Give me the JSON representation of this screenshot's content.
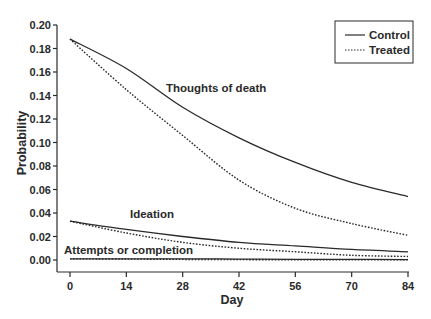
{
  "chart_data": {
    "type": "line",
    "title": "",
    "xlabel": "Day",
    "ylabel": "Probability",
    "xlim": [
      0,
      84
    ],
    "ylim": [
      0,
      0.2
    ],
    "x_ticks": [
      0,
      14,
      28,
      42,
      56,
      70,
      84
    ],
    "x_tick_labels": [
      "0",
      "14",
      "28",
      "42",
      "56",
      "70",
      "84"
    ],
    "y_ticks": [
      0.0,
      0.02,
      0.04,
      0.06,
      0.08,
      0.1,
      0.12,
      0.14,
      0.16,
      0.18,
      0.2
    ],
    "y_tick_labels": [
      "0.00",
      "0.02",
      "0.04",
      "0.06",
      "0.08",
      "0.10",
      "0.12",
      "0.14",
      "0.16",
      "0.18",
      "0.20"
    ],
    "grid": false,
    "legend_position": "top-right",
    "legend": [
      {
        "label": "Control",
        "style": "solid"
      },
      {
        "label": "Treated",
        "style": "dotted"
      }
    ],
    "x": [
      0,
      14,
      28,
      42,
      56,
      70,
      84
    ],
    "series": [
      {
        "name": "Thoughts of death - Control",
        "group": "Thoughts of death",
        "arm": "Control",
        "style": "solid",
        "values": [
          0.188,
          0.163,
          0.13,
          0.104,
          0.083,
          0.066,
          0.054
        ]
      },
      {
        "name": "Thoughts of death - Treated",
        "group": "Thoughts of death",
        "arm": "Treated",
        "style": "dotted",
        "values": [
          0.188,
          0.145,
          0.106,
          0.068,
          0.044,
          0.031,
          0.021
        ]
      },
      {
        "name": "Ideation - Control",
        "group": "Ideation",
        "arm": "Control",
        "style": "solid",
        "values": [
          0.033,
          0.026,
          0.02,
          0.015,
          0.012,
          0.009,
          0.007
        ]
      },
      {
        "name": "Ideation - Treated",
        "group": "Ideation",
        "arm": "Treated",
        "style": "dotted",
        "values": [
          0.033,
          0.023,
          0.015,
          0.01,
          0.007,
          0.004,
          0.003
        ]
      },
      {
        "name": "Attempts or completion - Control",
        "group": "Attempts or completion",
        "arm": "Control",
        "style": "solid",
        "values": [
          0.001,
          0.001,
          0.001,
          0.0008,
          0.0006,
          0.0005,
          0.0004
        ]
      },
      {
        "name": "Attempts or completion - Treated",
        "group": "Attempts or completion",
        "arm": "Treated",
        "style": "dotted",
        "values": [
          0.001,
          0.0008,
          0.0005,
          0.0003,
          0.0002,
          0.0001,
          0.0001
        ]
      }
    ],
    "annotations": [
      {
        "text": "Thoughts of death",
        "x_px": 166,
        "y_px": 92
      },
      {
        "text": "Ideation",
        "x_px": 130,
        "y_px": 218
      },
      {
        "text": "Attempts or completion",
        "x_px": 64,
        "y_px": 254
      }
    ]
  },
  "colors": {
    "line": "#2a2a2a",
    "background": "#ffffff"
  }
}
